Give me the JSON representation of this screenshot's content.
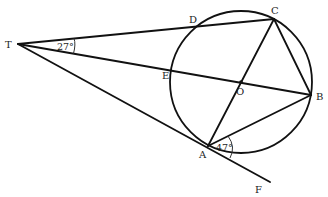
{
  "diagram": {
    "type": "geometry",
    "points": {
      "T": {
        "label": "T",
        "x": 18,
        "y": 44
      },
      "D": {
        "label": "D",
        "x": 196,
        "y": 27
      },
      "C": {
        "label": "C",
        "x": 274,
        "y": 19
      },
      "E": {
        "label": "E",
        "x": 171,
        "y": 66
      },
      "O": {
        "label": "O",
        "x": 241,
        "y": 82
      },
      "B": {
        "label": "B",
        "x": 311,
        "y": 95
      },
      "A": {
        "label": "A",
        "x": 208,
        "y": 146
      },
      "F": {
        "label": "F",
        "x": 270,
        "y": 182
      }
    },
    "circle": {
      "center": "O",
      "radius": 71
    },
    "segments": [
      "T-C",
      "T-B",
      "T-F",
      "A-C",
      "C-B",
      "A-B"
    ],
    "angles": [
      {
        "vertex": "T",
        "label": "27°",
        "between": [
          "TC",
          "TB"
        ]
      },
      {
        "vertex": "A",
        "label": "47°",
        "between": [
          "AB",
          "AF"
        ]
      }
    ]
  }
}
